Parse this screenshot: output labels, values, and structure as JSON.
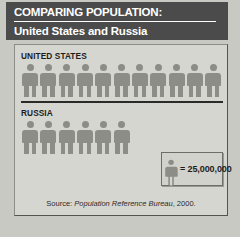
{
  "header": {
    "title": "COMPARING POPULATION:",
    "subtitle": "United States and Russia"
  },
  "legend": {
    "symbol_name": "person-icon",
    "text": "= 25,000,000"
  },
  "source": {
    "prefix": "Source:",
    "publication": "Population Reference Bureau",
    "suffix": ", 2000."
  },
  "colors": {
    "header_background": "#4b4b4b",
    "page_background": "#c9c9c4",
    "panel_background": "#d6d6d1",
    "figure": "#8d8d88",
    "divider": "#2a2a28",
    "text_dark": "#1d1d1d",
    "text_light": "#ffffff"
  },
  "chart_data": {
    "type": "pictogram",
    "title": "COMPARING POPULATION: United States and Russia",
    "unit_value": 25000000,
    "unit_label": "= 25,000,000",
    "symbol": "person",
    "categories": [
      "UNITED STATES",
      "RUSSIA"
    ],
    "values": [
      275000000,
      150000000
    ],
    "icon_counts": [
      11,
      6
    ],
    "series": [
      {
        "name": "Population",
        "values": [
          275000000,
          150000000
        ]
      }
    ],
    "xlabel": "",
    "ylabel": "",
    "grid": false,
    "legend_position": "bottom-right",
    "annotations": [
      "Source: Population Reference Bureau, 2000."
    ]
  }
}
